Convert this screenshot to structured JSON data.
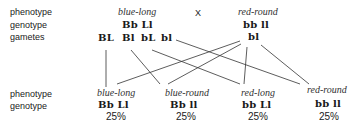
{
  "row_labels": {
    "phenotype_top": "phenotype",
    "genotype_top": "genotype",
    "gametes": "gametes",
    "phenotype_bottom": "phenotype",
    "genotype_bottom": "genotype"
  },
  "cross_symbol": "X",
  "parent1": {
    "phenotype": "blue-long",
    "genotype": "Bb  Ll",
    "gametes": [
      "BL",
      "Bl",
      "bL",
      "bl"
    ]
  },
  "parent2": {
    "phenotype": "red-round",
    "genotype": "bb  ll",
    "gametes": [
      "bl"
    ]
  },
  "offspring": [
    {
      "phenotype": "blue-long",
      "genotype": "Bb  Ll",
      "percent": "25%"
    },
    {
      "phenotype": "blue-round",
      "genotype": "Bb  ll",
      "percent": "25%"
    },
    {
      "phenotype": "red-long",
      "genotype": "bb  Ll",
      "percent": "25%"
    },
    {
      "phenotype": "red-round",
      "genotype": "bb  ll",
      "percent": "25%"
    }
  ]
}
